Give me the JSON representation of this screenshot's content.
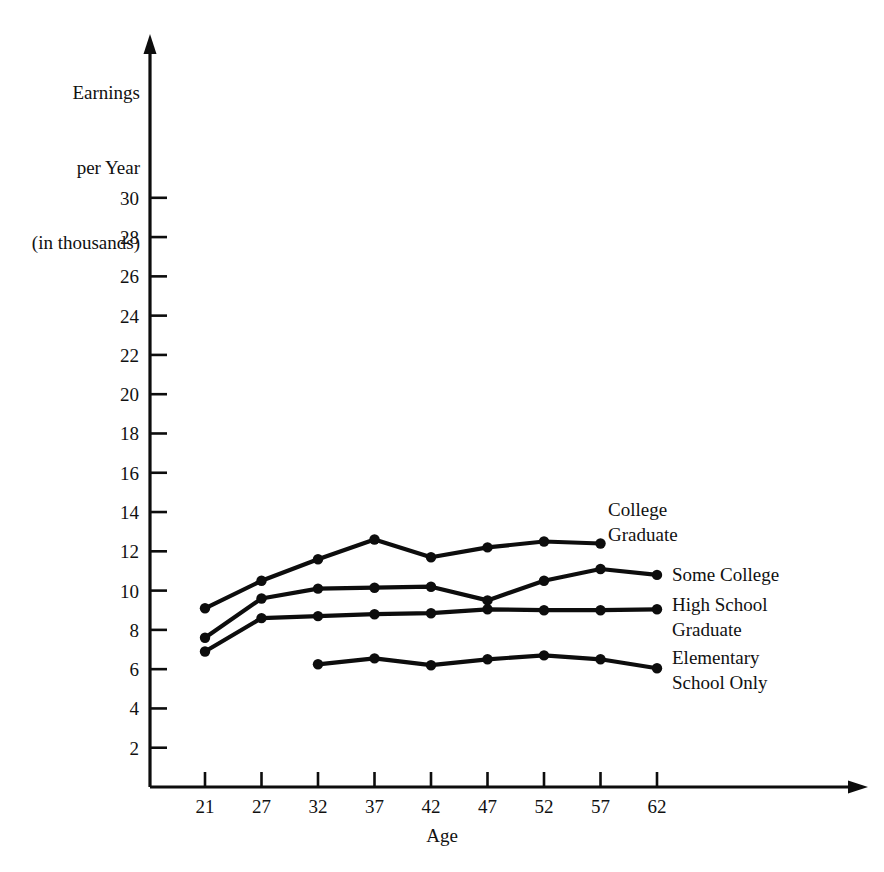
{
  "chart_data": {
    "type": "line",
    "title": "",
    "xlabel": "Age",
    "ylabel": "Earnings per Year (in thousands)",
    "ylabel_lines": [
      "Earnings",
      "per Year",
      "(in thousands)"
    ],
    "categories": [
      21,
      27,
      32,
      37,
      42,
      47,
      52,
      57,
      62
    ],
    "xtick_labels": [
      "21",
      "27",
      "32",
      "37",
      "42",
      "47",
      "52",
      "57",
      "62"
    ],
    "ytick_labels": [
      "30",
      "28",
      "26",
      "24",
      "22",
      "20",
      "18",
      "16",
      "14",
      "12",
      "10",
      "8",
      "6",
      "4",
      "2"
    ],
    "ytick_values": [
      30,
      28,
      26,
      24,
      22,
      20,
      18,
      16,
      14,
      12,
      10,
      8,
      6,
      4,
      2
    ],
    "ylim": [
      0,
      31
    ],
    "xlim": [
      18.5,
      66
    ],
    "grid": false,
    "legend_position": "right-inline",
    "marker": "filled-circle",
    "line_color": "#0d0d0d",
    "series": [
      {
        "name": "College Graduate",
        "label_lines": [
          "College",
          "Graduate"
        ],
        "x": [
          21,
          27,
          32,
          37,
          42,
          47,
          52,
          57,
          62
        ],
        "values": [
          9.1,
          10.5,
          11.6,
          12.6,
          11.7,
          12.2,
          12.5,
          12.4,
          null
        ]
      },
      {
        "name": "Some College",
        "label_lines": [
          "Some College"
        ],
        "x": [
          21,
          27,
          32,
          37,
          42,
          47,
          52,
          57,
          62
        ],
        "values": [
          7.6,
          9.6,
          10.1,
          10.15,
          10.2,
          9.5,
          10.5,
          11.1,
          10.8
        ]
      },
      {
        "name": "High School Graduate",
        "label_lines": [
          "High School",
          "Graduate"
        ],
        "x": [
          21,
          27,
          32,
          37,
          42,
          47,
          52,
          57,
          62
        ],
        "values": [
          6.9,
          8.6,
          8.7,
          8.8,
          8.85,
          9.05,
          9.0,
          9.0,
          9.05
        ]
      },
      {
        "name": "Elementary School Only",
        "label_lines": [
          "Elementary",
          "School Only"
        ],
        "x": [
          32,
          37,
          42,
          47,
          52,
          57,
          62
        ],
        "values": [
          6.25,
          6.55,
          6.2,
          6.5,
          6.7,
          6.5,
          6.05
        ]
      }
    ]
  },
  "axes": {
    "y_title_lines": [
      "Earnings",
      "per Year",
      "(in thousands)"
    ],
    "x_title": "Age"
  },
  "labels": {
    "college_graduate": [
      "College",
      "Graduate"
    ],
    "some_college": [
      "Some College"
    ],
    "high_school": [
      "High School",
      "Graduate"
    ],
    "elementary": [
      "Elementary",
      "School Only"
    ]
  }
}
